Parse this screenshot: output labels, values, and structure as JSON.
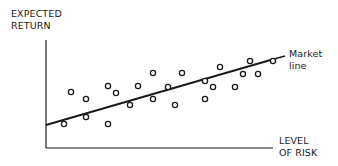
{
  "chart_data": {
    "type": "scatter",
    "title": "",
    "ylabel": "EXPECTED RETURN",
    "xlabel": "LEVEL OF RISK",
    "ylabel_lines": [
      "EXPECTED",
      "RETURN"
    ],
    "xlabel_lines": [
      "LEVEL",
      "OF RISK"
    ],
    "grid": false,
    "legend": null,
    "annotations": [
      {
        "text_lines": [
          "Market",
          "line"
        ],
        "target": "market-line"
      }
    ],
    "market_line": {
      "x1": 46,
      "y1": 125,
      "x2": 274,
      "y2": 59
    },
    "points": [
      {
        "x": 64,
        "y": 124
      },
      {
        "x": 71,
        "y": 92
      },
      {
        "x": 86,
        "y": 99
      },
      {
        "x": 86,
        "y": 117
      },
      {
        "x": 108,
        "y": 86
      },
      {
        "x": 108,
        "y": 124
      },
      {
        "x": 116,
        "y": 93
      },
      {
        "x": 130,
        "y": 105
      },
      {
        "x": 138,
        "y": 86
      },
      {
        "x": 153,
        "y": 73
      },
      {
        "x": 153,
        "y": 99
      },
      {
        "x": 168,
        "y": 87
      },
      {
        "x": 175,
        "y": 105
      },
      {
        "x": 182,
        "y": 73
      },
      {
        "x": 205,
        "y": 81
      },
      {
        "x": 205,
        "y": 99
      },
      {
        "x": 213,
        "y": 87
      },
      {
        "x": 220,
        "y": 67
      },
      {
        "x": 235,
        "y": 87
      },
      {
        "x": 243,
        "y": 74
      },
      {
        "x": 250,
        "y": 61
      },
      {
        "x": 258,
        "y": 74
      },
      {
        "x": 273,
        "y": 61
      }
    ],
    "note": "Point coordinates are in screen-pixel space (no numeric axis ticks shown); positive relationship between risk and expected return"
  },
  "labels": {
    "y_axis_line1": "EXPECTED",
    "y_axis_line2": "RETURN",
    "x_axis_line1": "LEVEL",
    "x_axis_line2": "OF RISK",
    "market_line1": "Market",
    "market_line2": "line"
  },
  "colors": {
    "ink": "#1a1a1a",
    "background": "#ffffff"
  }
}
